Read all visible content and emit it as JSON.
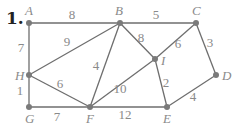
{
  "problem_number": "1.",
  "colors": {
    "edge": "#6e6e6e",
    "node": "#7a7a7a",
    "label": "#8a8a8a",
    "number": "#222222"
  },
  "nodes": [
    {
      "id": "A",
      "label": "A",
      "x": 29,
      "y": 23,
      "lx": 25,
      "ly": 15
    },
    {
      "id": "B",
      "label": "B",
      "x": 120,
      "y": 23,
      "lx": 115,
      "ly": 15
    },
    {
      "id": "C",
      "label": "C",
      "x": 196,
      "y": 23,
      "lx": 192,
      "ly": 15
    },
    {
      "id": "I",
      "label": "I",
      "x": 155,
      "y": 59,
      "lx": 161,
      "ly": 65
    },
    {
      "id": "D",
      "label": "D",
      "x": 216,
      "y": 75,
      "lx": 222,
      "ly": 80
    },
    {
      "id": "E",
      "label": "E",
      "x": 167,
      "y": 107,
      "lx": 163,
      "ly": 123
    },
    {
      "id": "F",
      "label": "F",
      "x": 90,
      "y": 107,
      "lx": 86,
      "ly": 123
    },
    {
      "id": "G",
      "label": "G",
      "x": 29,
      "y": 107,
      "lx": 25,
      "ly": 123
    },
    {
      "id": "H",
      "label": "H",
      "x": 29,
      "y": 75,
      "lx": 15,
      "ly": 80
    }
  ],
  "edges": [
    {
      "from": "A",
      "to": "B",
      "weight": "8",
      "wx": 72,
      "wy": 19
    },
    {
      "from": "B",
      "to": "C",
      "weight": "5",
      "wx": 156,
      "wy": 19
    },
    {
      "from": "A",
      "to": "H",
      "weight": "7",
      "wx": 21,
      "wy": 52
    },
    {
      "from": "H",
      "to": "B",
      "weight": "9",
      "wx": 67,
      "wy": 46
    },
    {
      "from": "B",
      "to": "I",
      "weight": "8",
      "wx": 141,
      "wy": 42
    },
    {
      "from": "C",
      "to": "I",
      "weight": "6",
      "wx": 178,
      "wy": 48
    },
    {
      "from": "C",
      "to": "D",
      "weight": "3",
      "wx": 210,
      "wy": 47
    },
    {
      "from": "B",
      "to": "F",
      "weight": "4",
      "wx": 96,
      "wy": 70
    },
    {
      "from": "H",
      "to": "F",
      "weight": "6",
      "wx": 60,
      "wy": 88
    },
    {
      "from": "H",
      "to": "G",
      "weight": "1",
      "wx": 20,
      "wy": 95
    },
    {
      "from": "G",
      "to": "F",
      "weight": "7",
      "wx": 57,
      "wy": 121
    },
    {
      "from": "F",
      "to": "I",
      "weight": "10",
      "wx": 120,
      "wy": 93
    },
    {
      "from": "I",
      "to": "E",
      "weight": "2",
      "wx": 166,
      "wy": 87
    },
    {
      "from": "F",
      "to": "E",
      "weight": "12",
      "wx": 125,
      "wy": 119
    },
    {
      "from": "E",
      "to": "D",
      "weight": "4",
      "wx": 193,
      "wy": 101
    }
  ]
}
